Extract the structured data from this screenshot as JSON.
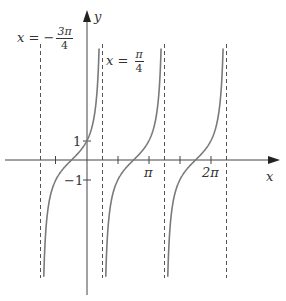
{
  "diagram": {
    "function": "y = tan(x + π/4)",
    "axes": {
      "x_label": "x",
      "y_label": "y",
      "x_ticks": [
        {
          "value": "-π/2",
          "label": ""
        },
        {
          "value": "π/2",
          "label": ""
        },
        {
          "value": "π",
          "label": "π"
        },
        {
          "value": "3π/2",
          "label": ""
        },
        {
          "value": "2π",
          "label": "2π"
        }
      ],
      "y_ticks": [
        {
          "value": 1,
          "label": "1"
        },
        {
          "value": -1,
          "label": "−1"
        }
      ]
    },
    "asymptotes": [
      {
        "x": "-3π/4",
        "label_lhs": "x =",
        "label_sign": "−",
        "label_num": "3π",
        "label_den": "4"
      },
      {
        "x": "π/4",
        "label_lhs": "x =",
        "label_sign": "",
        "label_num": "π",
        "label_den": "4"
      },
      {
        "x": "5π/4"
      },
      {
        "x": "9π/4"
      }
    ],
    "colors": {
      "curve": "#7a7a7a",
      "axis": "#444444",
      "asymptote": "#555555",
      "text": "#333333"
    }
  }
}
